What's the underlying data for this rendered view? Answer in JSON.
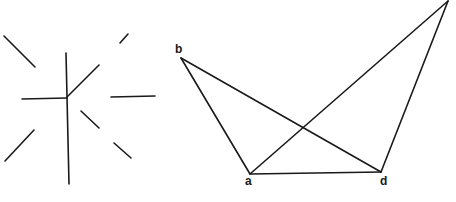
{
  "figures": [
    {
      "name": "radial-line-fragments",
      "lines": [
        {
          "x1": 4,
          "y1": 36,
          "x2": 35,
          "y2": 67
        },
        {
          "x1": 66,
          "y1": 53,
          "x2": 69,
          "y2": 184
        },
        {
          "x1": 22,
          "y1": 99,
          "x2": 67,
          "y2": 98
        },
        {
          "x1": 67,
          "y1": 97,
          "x2": 99,
          "y2": 65
        },
        {
          "x1": 120,
          "y1": 43,
          "x2": 128,
          "y2": 34
        },
        {
          "x1": 111,
          "y1": 97,
          "x2": 155,
          "y2": 96
        },
        {
          "x1": 81,
          "y1": 111,
          "x2": 99,
          "y2": 128
        },
        {
          "x1": 5,
          "y1": 161,
          "x2": 34,
          "y2": 130
        },
        {
          "x1": 114,
          "y1": 143,
          "x2": 131,
          "y2": 158
        }
      ]
    },
    {
      "name": "crossed-quadrilateral",
      "points": {
        "b": {
          "x": 181,
          "y": 58
        },
        "a": {
          "x": 250,
          "y": 174
        },
        "d": {
          "x": 381,
          "y": 172
        },
        "c": {
          "x": 448,
          "y": 1
        }
      },
      "labels": [
        {
          "id": "b",
          "text": "b",
          "x": 175,
          "y": 53
        },
        {
          "id": "a",
          "text": "a",
          "x": 245,
          "y": 185
        },
        {
          "id": "d",
          "text": "d",
          "x": 380,
          "y": 185
        }
      ],
      "edges": [
        [
          "b",
          "a"
        ],
        [
          "b",
          "d"
        ],
        [
          "a",
          "d"
        ],
        [
          "a",
          "c"
        ],
        [
          "d",
          "c"
        ]
      ]
    }
  ],
  "colors": {
    "ink": "#1a1a1a",
    "background": "#ffffff"
  }
}
